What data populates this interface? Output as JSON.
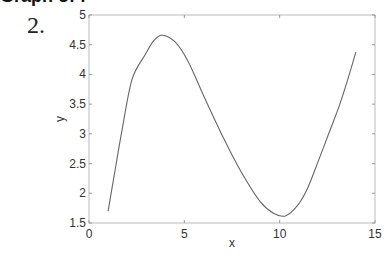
{
  "header": {
    "cropped_title": "Graph of f"
  },
  "problem": {
    "number_label": "2."
  },
  "chart_data": {
    "type": "line",
    "title": "",
    "xlabel": "x",
    "ylabel": "y",
    "xlim": [
      0,
      15
    ],
    "ylim": [
      1.5,
      5
    ],
    "xticks": [
      0,
      5,
      10,
      15
    ],
    "xtick_labels": [
      "0",
      "5",
      "10",
      "15"
    ],
    "yticks": [
      1.5,
      2,
      2.5,
      3,
      3.5,
      4,
      4.5,
      5
    ],
    "ytick_labels": [
      "1.5",
      "2",
      "2.5",
      "3",
      "3.5",
      "4",
      "4.5",
      "5"
    ],
    "grid": false,
    "legend": null,
    "series": [
      {
        "name": "y",
        "color": "#666666",
        "x": [
          1.0,
          1.4,
          1.73,
          2.25,
          2.94,
          3.4,
          3.83,
          4.5,
          5.2,
          6.0,
          7.1,
          8.0,
          9.0,
          9.7,
          10.3,
          10.9,
          11.43,
          12.0,
          12.64,
          13.1,
          13.48,
          14.0
        ],
        "y": [
          1.7,
          2.45,
          3.06,
          3.91,
          4.33,
          4.57,
          4.66,
          4.55,
          4.22,
          3.65,
          2.9,
          2.35,
          1.85,
          1.66,
          1.62,
          1.78,
          2.06,
          2.52,
          3.06,
          3.45,
          3.82,
          4.38
        ]
      }
    ]
  }
}
